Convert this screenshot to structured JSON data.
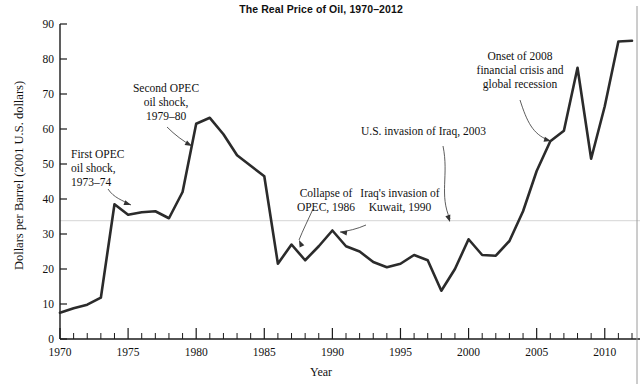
{
  "chart_data": {
    "type": "line",
    "title": "The Real Price of Oil, 1970–2012",
    "xlabel": "Year",
    "ylabel": "Dollars per Barrel (2001 U.S. dollars)",
    "xlim": [
      1970,
      2012
    ],
    "ylim": [
      0,
      90
    ],
    "ytick_step": 10,
    "xtick_major_step": 5,
    "xtick_minor_step": 1,
    "grid": "single horizontal gridline near 34",
    "gridline_value": 33.8,
    "legend": "none",
    "line_color": "#2b2b2b",
    "yticks": [
      0,
      10,
      20,
      30,
      40,
      50,
      60,
      70,
      80,
      90
    ],
    "xticks": [
      1970,
      1975,
      1980,
      1985,
      1990,
      1995,
      2000,
      2005,
      2010
    ],
    "x": [
      1970,
      1971,
      1972,
      1973,
      1974,
      1975,
      1976,
      1977,
      1978,
      1979,
      1980,
      1981,
      1982,
      1983,
      1984,
      1985,
      1986,
      1987,
      1988,
      1989,
      1990,
      1991,
      1992,
      1993,
      1994,
      1995,
      1996,
      1997,
      1998,
      1999,
      2000,
      2001,
      2002,
      2003,
      2004,
      2005,
      2006,
      2007,
      2008,
      2009,
      2010,
      2011,
      2012
    ],
    "values": [
      7.5,
      8.8,
      9.8,
      11.8,
      38.5,
      35.5,
      36.2,
      36.5,
      34.5,
      42.0,
      61.5,
      63.2,
      58.5,
      52.5,
      49.5,
      46.5,
      21.5,
      27.0,
      22.5,
      26.5,
      31.0,
      26.5,
      25.0,
      22.0,
      20.5,
      21.5,
      24.0,
      22.5,
      13.8,
      20.0,
      28.5,
      24.0,
      23.8,
      28.0,
      36.5,
      48.0,
      56.5,
      59.5,
      77.5,
      51.5,
      66.5,
      85.0,
      85.2
    ],
    "annotations": [
      {
        "id": "first-opec",
        "text": [
          "First OPEC",
          "oil shock,",
          "1973–74"
        ],
        "text_x": 71,
        "text_y": 158,
        "text_anchor": "start",
        "leader": "M 108 189 C 114 198, 122 200, 131 205",
        "arrow": [
          131,
          205,
          20
        ]
      },
      {
        "id": "second-opec",
        "text": [
          "Second OPEC",
          "oil shock,",
          "1979–80"
        ],
        "text_x": 166,
        "text_y": 92,
        "text_anchor": "middle",
        "leader": "M 167 127 C 175 135, 183 141, 192 146",
        "arrow": [
          192,
          146,
          28
        ]
      },
      {
        "id": "collapse-opec",
        "text": [
          "Collapse of",
          "OPEC, 1986"
        ],
        "text_x": 326,
        "text_y": 197,
        "text_anchor": "middle",
        "leader": "M 313 209 C 308 220, 303 230, 299 240",
        "arrow": [
          299,
          240,
          245
        ]
      },
      {
        "id": "kuwait-invasion",
        "text": [
          "Iraq's invasion of",
          "Kuwait, 1990"
        ],
        "text_x": 400,
        "text_y": 197,
        "text_anchor": "middle",
        "leader": "M 366 225 C 357 229, 348 231, 340 232",
        "arrow": [
          340,
          232,
          188
        ]
      },
      {
        "id": "iraq-invasion",
        "text": [
          "U.S. invasion of Iraq, 2003"
        ],
        "text_x": 361,
        "text_y": 135,
        "text_anchor": "start",
        "leader": "M 443 146 C 449 175, 439 195, 450 219",
        "arrow": [
          450,
          222,
          72
        ]
      },
      {
        "id": "financial-crisis",
        "text": [
          "Onset of 2008",
          "financial crisis and",
          "global recession"
        ],
        "text_x": 520,
        "text_y": 60,
        "text_anchor": "middle",
        "leader": "M 520 100 C 527 122, 533 134, 548 140",
        "arrow": [
          551,
          141,
          15
        ]
      }
    ]
  }
}
